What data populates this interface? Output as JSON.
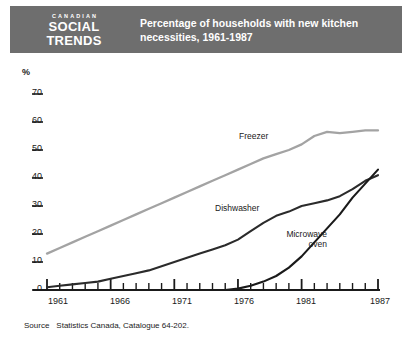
{
  "banner": {
    "logo_kicker": "CANADIAN",
    "logo_line1": "SOCIAL",
    "logo_line2": "TRENDS",
    "title_line1": "Percentage of households with new kitchen",
    "title_line2": "necessities, 1961-1987"
  },
  "footer": {
    "source_word": "Source",
    "source_text": "Statistics Canada, Catalogue 64-202."
  },
  "axis": {
    "y_unit": "%",
    "y_ticks": [
      "70",
      "60",
      "50",
      "40",
      "30",
      "20",
      "10",
      "0"
    ],
    "x_ticks": [
      "1961",
      "1966",
      "1971",
      "1976",
      "1981",
      "1987"
    ]
  },
  "colors": {
    "banner_bg": "#6e6e6e",
    "freezer": "#a3a3a3",
    "dishwasher": "#2b2b2b",
    "microwave": "#1a1a1a",
    "axis": "#1a1a1a",
    "frame": "#4a4a4a"
  },
  "chart_data": {
    "type": "line",
    "title": "Percentage of households with new kitchen necessities, 1961-1987",
    "xlabel": "",
    "ylabel": "%",
    "ylim": [
      0,
      70
    ],
    "xlim": [
      1961,
      1987
    ],
    "grid": false,
    "legend": "inline-labels",
    "x": [
      1961,
      1962,
      1963,
      1964,
      1965,
      1966,
      1967,
      1968,
      1969,
      1970,
      1971,
      1972,
      1973,
      1974,
      1975,
      1976,
      1977,
      1978,
      1979,
      1980,
      1981,
      1982,
      1983,
      1984,
      1985,
      1986,
      1987
    ],
    "series": [
      {
        "name": "Freezer",
        "color": "#a3a3a3",
        "values": [
          13,
          15,
          17,
          19,
          21,
          23,
          25,
          27,
          29,
          31,
          33,
          35,
          37,
          39,
          41,
          43,
          45,
          47,
          48.5,
          50,
          52,
          55,
          56.5,
          56,
          56.5,
          57,
          57
        ]
      },
      {
        "name": "Dishwasher",
        "color": "#2b2b2b",
        "values": [
          1,
          1.5,
          2,
          2.5,
          3,
          4,
          5,
          6,
          7,
          8.5,
          10,
          11.5,
          13,
          14.5,
          16,
          18,
          21,
          24,
          26.5,
          28,
          30,
          31,
          32,
          33.5,
          36,
          39,
          41
        ]
      },
      {
        "name": "Microwave oven",
        "color": "#1a1a1a",
        "values": [
          0,
          0,
          0,
          0,
          0,
          0,
          0,
          0,
          0,
          0,
          0,
          0,
          0,
          0,
          0,
          0.5,
          1.5,
          3,
          5,
          8,
          12,
          17,
          22,
          27,
          33,
          38,
          43
        ]
      }
    ],
    "annotations": [
      {
        "text": "Freezer",
        "x": 1975,
        "y": 51
      },
      {
        "text": "Dishwasher",
        "x": 1973,
        "y": 27
      },
      {
        "text": "Microwave oven",
        "x": 1979,
        "y": 19
      }
    ]
  }
}
